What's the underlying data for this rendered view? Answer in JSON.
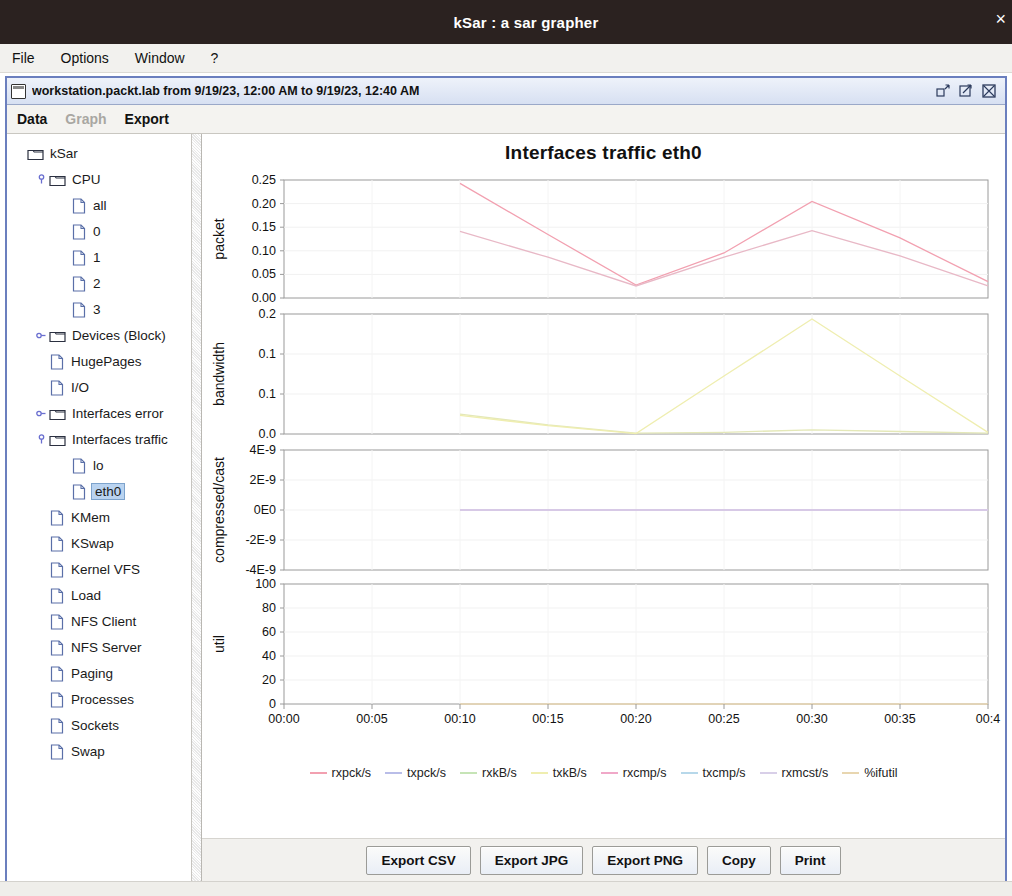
{
  "os_window": {
    "title": "kSar : a sar grapher",
    "close_glyph": "×"
  },
  "menubar": {
    "items": [
      {
        "label": "File"
      },
      {
        "label": "Options"
      },
      {
        "label": "Window"
      },
      {
        "label": "?"
      }
    ]
  },
  "internal_frame": {
    "title": "workstation.packt.lab from 9/19/23, 12:00 AM to 9/19/23, 12:40 AM",
    "window_buttons": [
      {
        "name": "restore-button",
        "tooltip": "Restore"
      },
      {
        "name": "maximize-button",
        "tooltip": "Maximize"
      },
      {
        "name": "close-button",
        "tooltip": "Close"
      }
    ]
  },
  "tabs": [
    {
      "label": "Data",
      "enabled": true
    },
    {
      "label": "Graph",
      "enabled": false
    },
    {
      "label": "Export",
      "enabled": true
    }
  ],
  "tree": {
    "nodes": [
      {
        "label": "kSar",
        "depth": 0,
        "icon": "folder",
        "handle": "none",
        "selected": false
      },
      {
        "label": "CPU",
        "depth": 1,
        "icon": "folder",
        "handle": "expanded",
        "selected": false
      },
      {
        "label": "all",
        "depth": 2,
        "icon": "doc",
        "handle": "none",
        "selected": false
      },
      {
        "label": "0",
        "depth": 2,
        "icon": "doc",
        "handle": "none",
        "selected": false
      },
      {
        "label": "1",
        "depth": 2,
        "icon": "doc",
        "handle": "none",
        "selected": false
      },
      {
        "label": "2",
        "depth": 2,
        "icon": "doc",
        "handle": "none",
        "selected": false
      },
      {
        "label": "3",
        "depth": 2,
        "icon": "doc",
        "handle": "none",
        "selected": false
      },
      {
        "label": "Devices (Block)",
        "depth": 1,
        "icon": "folder",
        "handle": "collapsed",
        "selected": false
      },
      {
        "label": "HugePages",
        "depth": 1,
        "icon": "doc",
        "handle": "none",
        "selected": false
      },
      {
        "label": "I/O",
        "depth": 1,
        "icon": "doc",
        "handle": "none",
        "selected": false
      },
      {
        "label": "Interfaces error",
        "depth": 1,
        "icon": "folder",
        "handle": "collapsed",
        "selected": false
      },
      {
        "label": "Interfaces traffic",
        "depth": 1,
        "icon": "folder",
        "handle": "expanded",
        "selected": false
      },
      {
        "label": "lo",
        "depth": 2,
        "icon": "doc",
        "handle": "none",
        "selected": false
      },
      {
        "label": "eth0",
        "depth": 2,
        "icon": "doc",
        "handle": "none",
        "selected": true
      },
      {
        "label": "KMem",
        "depth": 1,
        "icon": "doc",
        "handle": "none",
        "selected": false
      },
      {
        "label": "KSwap",
        "depth": 1,
        "icon": "doc",
        "handle": "none",
        "selected": false
      },
      {
        "label": "Kernel VFS",
        "depth": 1,
        "icon": "doc",
        "handle": "none",
        "selected": false
      },
      {
        "label": "Load",
        "depth": 1,
        "icon": "doc",
        "handle": "none",
        "selected": false
      },
      {
        "label": "NFS Client",
        "depth": 1,
        "icon": "doc",
        "handle": "none",
        "selected": false
      },
      {
        "label": "NFS Server",
        "depth": 1,
        "icon": "doc",
        "handle": "none",
        "selected": false
      },
      {
        "label": "Paging",
        "depth": 1,
        "icon": "doc",
        "handle": "none",
        "selected": false
      },
      {
        "label": "Processes",
        "depth": 1,
        "icon": "doc",
        "handle": "none",
        "selected": false
      },
      {
        "label": "Sockets",
        "depth": 1,
        "icon": "doc",
        "handle": "none",
        "selected": false
      },
      {
        "label": "Swap",
        "depth": 1,
        "icon": "doc",
        "handle": "none",
        "selected": false
      }
    ]
  },
  "buttons": [
    {
      "label": "Export CSV"
    },
    {
      "label": "Export JPG"
    },
    {
      "label": "Export PNG"
    },
    {
      "label": "Copy"
    },
    {
      "label": "Print"
    }
  ],
  "chart_data": {
    "type": "line",
    "title": "Interfaces traffic eth0",
    "xlabel": "",
    "xticks": [
      "00:00",
      "00:05",
      "00:10",
      "00:15",
      "00:20",
      "00:25",
      "00:30",
      "00:35",
      "00:4"
    ],
    "xlim": [
      0,
      40
    ],
    "legend_position": "bottom",
    "grid": true,
    "legend": [
      {
        "name": "rxpck/s",
        "color": "#f2a0b0"
      },
      {
        "name": "txpck/s",
        "color": "#b9bde8"
      },
      {
        "name": "rxkB/s",
        "color": "#c6e4b6"
      },
      {
        "name": "txkB/s",
        "color": "#efeeb0"
      },
      {
        "name": "rxcmp/s",
        "color": "#f0a8c8"
      },
      {
        "name": "txcmp/s",
        "color": "#b7d8ea"
      },
      {
        "name": "rxmcst/s",
        "color": "#d8cfe8"
      },
      {
        "name": "%ifutil",
        "color": "#e8d6b0"
      }
    ],
    "panels": [
      {
        "ylabel": "packet",
        "yticks": [
          "0.00",
          "0.05",
          "0.10",
          "0.15",
          "0.20",
          "0.25"
        ],
        "ylim": [
          0,
          0.275
        ],
        "x": [
          10,
          15,
          20,
          25,
          30,
          35,
          40
        ],
        "series": [
          {
            "name": "rxpck/s",
            "color": "#f2a0b0",
            "values": [
              0.267,
              0.148,
              0.03,
              0.105,
              0.225,
              0.14,
              0.038
            ]
          },
          {
            "name": "txpck/s",
            "color": "#e8b8c6",
            "values": [
              0.155,
              0.095,
              0.028,
              0.095,
              0.157,
              0.098,
              0.028
            ]
          }
        ]
      },
      {
        "ylabel": "bandwidth",
        "yticks": [
          "0.0",
          "0.1",
          "0.1",
          "0.2"
        ],
        "ylim": [
          0,
          0.29
        ],
        "x": [
          10,
          15,
          20,
          25,
          30,
          35,
          40
        ],
        "series": [
          {
            "name": "rxkB/s",
            "color": "#e4e8b8",
            "values": [
              0.048,
              0.022,
              0.002,
              0.004,
              0.01,
              0.006,
              0.002
            ]
          },
          {
            "name": "txkB/s",
            "color": "#efeeb0",
            "values": [
              0.045,
              0.02,
              0.001,
              0.14,
              0.278,
              0.14,
              0.004
            ]
          }
        ]
      },
      {
        "ylabel": "compressed/cast",
        "yticks": [
          "-4E-9",
          "-2E-9",
          "0E0",
          "2E-9",
          "4E-9"
        ],
        "ylim": [
          -5e-09,
          5e-09
        ],
        "x": [
          10,
          15,
          20,
          25,
          30,
          35,
          40
        ],
        "series": [
          {
            "name": "rxcmp/s",
            "color": "#f0a8c8",
            "values": [
              0,
              0,
              0,
              0,
              0,
              0,
              0
            ]
          },
          {
            "name": "txcmp/s",
            "color": "#c8b8e0",
            "values": [
              0,
              0,
              0,
              0,
              0,
              0,
              0
            ]
          },
          {
            "name": "rxmcst/s",
            "color": "#d8cfe8",
            "values": [
              0,
              0,
              0,
              0,
              0,
              0,
              0
            ]
          }
        ]
      },
      {
        "ylabel": "util",
        "yticks": [
          "0",
          "20",
          "40",
          "60",
          "80",
          "100"
        ],
        "ylim": [
          0,
          100
        ],
        "x": [
          10,
          15,
          20,
          25,
          30,
          35,
          40
        ],
        "series": [
          {
            "name": "%ifutil",
            "color": "#e8d6b0",
            "values": [
              0,
              0,
              0,
              0,
              0,
              0,
              0
            ]
          }
        ]
      }
    ]
  }
}
